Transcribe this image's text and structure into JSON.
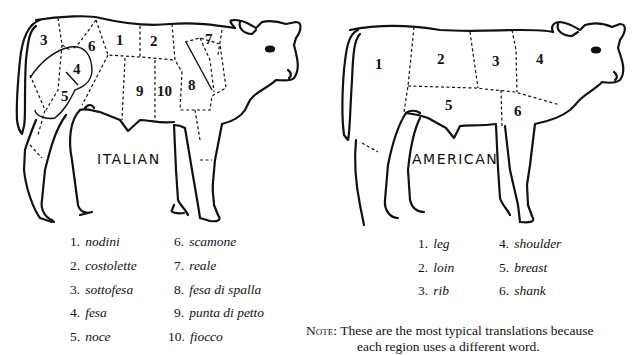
{
  "italian": {
    "label": "ITALIAN",
    "regions": [
      "1",
      "2",
      "3",
      "4",
      "5",
      "6",
      "7",
      "8",
      "9",
      "10"
    ],
    "legend": [
      {
        "num": "1.",
        "name": "nodini"
      },
      {
        "num": "2.",
        "name": "costolette"
      },
      {
        "num": "3.",
        "name": "sottofesa"
      },
      {
        "num": "4.",
        "name": "fesa"
      },
      {
        "num": "5.",
        "name": "noce"
      },
      {
        "num": "6.",
        "name": "scamone"
      },
      {
        "num": "7.",
        "name": "reale"
      },
      {
        "num": "8.",
        "name": "fesa di spalla"
      },
      {
        "num": "9.",
        "name": "punta di petto"
      },
      {
        "num": "10.",
        "name": "fiocco"
      }
    ]
  },
  "american": {
    "label": "AMERICAN",
    "regions": [
      "1",
      "2",
      "3",
      "4",
      "5",
      "6"
    ],
    "legend": [
      {
        "num": "1.",
        "name": "leg"
      },
      {
        "num": "2.",
        "name": "loin"
      },
      {
        "num": "3.",
        "name": "rib"
      },
      {
        "num": "4.",
        "name": "shoulder"
      },
      {
        "num": "5.",
        "name": "breast"
      },
      {
        "num": "6.",
        "name": "shank"
      }
    ]
  },
  "note": {
    "label": "Note:",
    "line1": "These are the most typical translations because",
    "line2": "each region uses a different word."
  }
}
